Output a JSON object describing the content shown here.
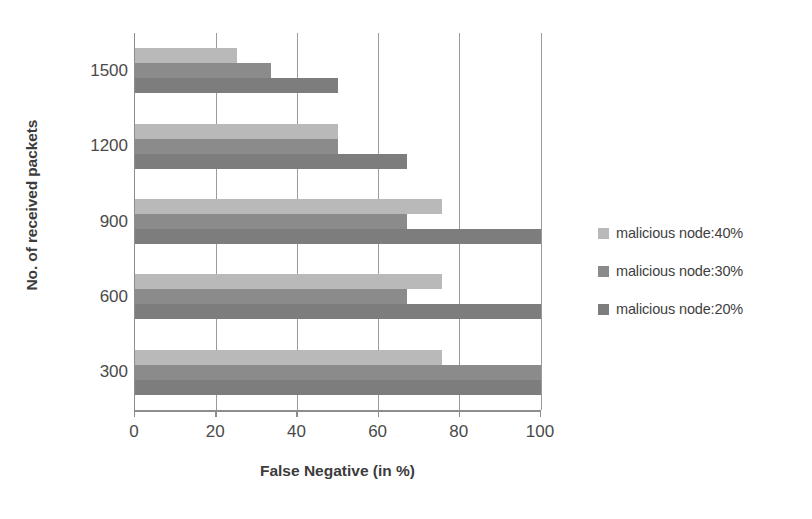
{
  "chart_data": {
    "type": "bar",
    "orientation": "horizontal",
    "title": "",
    "xlabel": "False Negative (in %)",
    "ylabel": "No. of received packets",
    "categories": [
      "1500",
      "1200",
      "900",
      "600",
      "300"
    ],
    "xlim": [
      0,
      100
    ],
    "xticks": [
      "0",
      "20",
      "40",
      "60",
      "80",
      "100"
    ],
    "xtick_values": [
      0,
      20,
      40,
      60,
      80,
      100
    ],
    "grid": "vertical",
    "legend_position": "right",
    "series": [
      {
        "name": "malicious node:40%",
        "color": "#b9b9b9",
        "values": [
          25,
          50,
          75.5,
          75.5,
          75.5
        ]
      },
      {
        "name": "malicious node:30%",
        "color": "#8b8b8b",
        "values": [
          33.5,
          50,
          67,
          67,
          100
        ]
      },
      {
        "name": "malicious node:20%",
        "color": "#7d7d7d",
        "values": [
          50,
          67,
          100,
          100,
          100
        ]
      }
    ]
  },
  "colors": {
    "series_40": "#b9b9b9",
    "series_30": "#8b8b8b",
    "series_20": "#7d7d7d",
    "axis": "#8d8d8d",
    "grid": "#9a9a9a",
    "text": "#3f3f3f",
    "background": "#ffffff"
  }
}
